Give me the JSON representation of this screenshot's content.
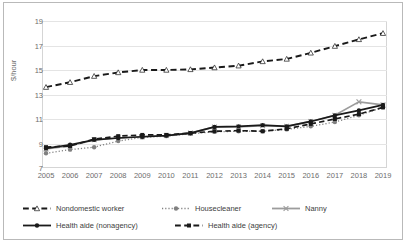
{
  "chart_data": {
    "type": "line",
    "title": "",
    "xlabel": "",
    "ylabel": "$/hour",
    "categories": [
      2005,
      2006,
      2007,
      2008,
      2009,
      2010,
      2011,
      2012,
      2013,
      2014,
      2015,
      2016,
      2017,
      2018,
      2019
    ],
    "x_tick_labels": [
      "2005",
      "2006",
      "2007",
      "2008",
      "2009",
      "2010",
      "2011",
      "2012",
      "2013",
      "2014",
      "2015",
      "2016",
      "2017",
      "2018",
      "2019"
    ],
    "y_tick_labels": [
      "7",
      "9",
      "11",
      "13",
      "15",
      "17",
      "19"
    ],
    "y_ticks": [
      7,
      9,
      11,
      13,
      15,
      17,
      19
    ],
    "ylim": [
      7,
      19
    ],
    "grid": true,
    "legend_position": "bottom",
    "series": [
      {
        "name": "Nondomestic worker",
        "marker": "open-triangle",
        "line_style": "dashed",
        "color": "#1a1a1a",
        "values": [
          13.6,
          14.0,
          14.5,
          14.8,
          15.0,
          15.0,
          15.05,
          15.2,
          15.35,
          15.7,
          15.9,
          16.4,
          16.95,
          17.5,
          18.0
        ]
      },
      {
        "name": "Housecleaner",
        "marker": "filled-circle",
        "line_style": "dotted",
        "color": "#808080",
        "values": [
          8.2,
          8.5,
          8.7,
          9.2,
          9.5,
          9.6,
          9.8,
          9.95,
          10.0,
          10.0,
          10.15,
          10.4,
          10.75,
          11.3,
          11.95
        ]
      },
      {
        "name": "Nanny",
        "marker": "x",
        "line_style": "solid",
        "color": "#9c9c9c",
        "values": [
          8.55,
          8.8,
          9.3,
          9.45,
          9.55,
          9.65,
          9.85,
          10.35,
          10.35,
          10.45,
          10.4,
          10.8,
          11.3,
          12.4,
          12.15
        ]
      },
      {
        "name": "Health aide (nonagency)",
        "marker": "filled-circle",
        "line_style": "solid",
        "color": "#1a1a1a",
        "values": [
          8.6,
          8.9,
          9.3,
          9.45,
          9.55,
          9.65,
          9.85,
          10.35,
          10.4,
          10.5,
          10.4,
          10.8,
          11.3,
          11.7,
          12.15
        ]
      },
      {
        "name": "Health aide (agency)",
        "marker": "filled-square",
        "line_style": "dashed",
        "color": "#1a1a1a",
        "values": [
          8.7,
          8.8,
          9.35,
          9.6,
          9.7,
          9.7,
          9.85,
          10.0,
          10.05,
          10.0,
          10.2,
          10.6,
          11.0,
          11.4,
          11.95
        ]
      }
    ]
  },
  "legend": {
    "items": [
      {
        "label": "Nondomestic worker"
      },
      {
        "label": "Housecleaner"
      },
      {
        "label": "Nanny"
      },
      {
        "label": "Health aide (nonagency)"
      },
      {
        "label": "Health aide (agency)"
      }
    ]
  }
}
